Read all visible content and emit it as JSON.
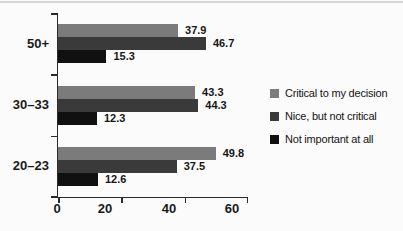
{
  "chart_data": {
    "type": "bar",
    "orientation": "horizontal",
    "title": "",
    "xlabel": "",
    "ylabel": "",
    "categories": [
      "50+",
      "30–33",
      "20–23"
    ],
    "series": [
      {
        "name": "Critical to my decision",
        "color": "#7b7b7b",
        "values": [
          37.9,
          43.3,
          49.8
        ]
      },
      {
        "name": "Nice, but not critical",
        "color": "#3a3a3a",
        "values": [
          46.7,
          44.3,
          37.5
        ]
      },
      {
        "name": "Not important at all",
        "color": "#101010",
        "values": [
          15.3,
          12.3,
          12.6
        ]
      }
    ],
    "xlim": [
      0,
      60
    ],
    "x_ticks": [
      "0",
      "20",
      "40",
      "60"
    ],
    "grid": false,
    "value_labels": true,
    "legend_position": "right"
  },
  "style": {
    "axis_color": "#2b2b2b",
    "text_color": "#1a1a1a",
    "top_rule_color": "#d7d7d7",
    "background": "#fbfbfb"
  }
}
